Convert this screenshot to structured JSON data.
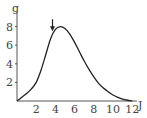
{
  "chart_data": {
    "type": "line",
    "title": "",
    "xlabel": "J",
    "ylabel": "g",
    "xlim": [
      0,
      12.5
    ],
    "ylim": [
      0,
      8.8
    ],
    "x_ticks": [
      2,
      4,
      6,
      8,
      10,
      12
    ],
    "y_ticks": [
      2,
      4,
      6,
      8
    ],
    "x_tick_labels": [
      "2",
      "4",
      "6",
      "8",
      "10",
      "12"
    ],
    "y_tick_labels": [
      "2",
      "4",
      "6",
      "8"
    ],
    "grid": false,
    "legend": null,
    "series": [
      {
        "name": "curve",
        "x": [
          0,
          0.5,
          1,
          1.5,
          2,
          2.5,
          3,
          3.5,
          4,
          4.5,
          5,
          5.5,
          6,
          6.5,
          7,
          7.5,
          8,
          8.5,
          9,
          9.5,
          10,
          10.5,
          11,
          11.5,
          12
        ],
        "values": [
          0,
          0.4,
          0.8,
          1.3,
          2.0,
          3.3,
          5.0,
          6.7,
          7.7,
          8.0,
          7.8,
          7.2,
          6.3,
          5.3,
          4.3,
          3.4,
          2.6,
          1.9,
          1.4,
          1.0,
          0.65,
          0.4,
          0.2,
          0.08,
          0.0
        ]
      }
    ],
    "annotations": [
      {
        "type": "arrow",
        "direction": "down",
        "x": 3.7,
        "y": 7.5,
        "label": ""
      }
    ]
  },
  "axes": {
    "x_unit": "J",
    "y_unit": "g"
  }
}
